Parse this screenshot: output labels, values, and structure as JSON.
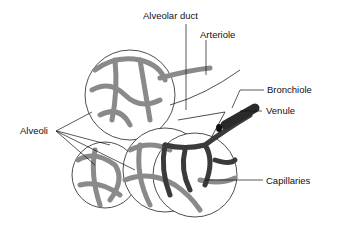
{
  "diagram": {
    "labels": {
      "alveolar_duct": "Alveolar duct",
      "arteriole": "Arteriole",
      "bronchiole": "Bronchiole",
      "venule": "Venule",
      "alveoli": "Alveoli",
      "capillaries": "Capillaries"
    },
    "colors": {
      "arteriole_vessels": "#8a8a8a",
      "venule_vessels": "#3a3a3a",
      "outline": "#222222",
      "background": "#ffffff"
    }
  }
}
